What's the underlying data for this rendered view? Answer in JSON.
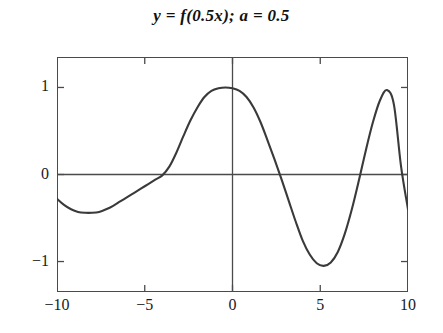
{
  "chart_data": {
    "type": "line",
    "title": "y = f(0.5x); a = 0.5",
    "xlabel": "",
    "ylabel": "",
    "xlim": [
      -10,
      10
    ],
    "ylim": [
      -1.35,
      1.35
    ],
    "grid": false,
    "legend": "none",
    "axis_lines": {
      "x_axis_at_y": 0,
      "y_axis_at_x": 0
    },
    "xticks": [
      -10,
      -5,
      0,
      5,
      10
    ],
    "xticklabels": [
      "−10",
      "−5",
      "0",
      "5",
      "10"
    ],
    "yticks": [
      1,
      0,
      -1
    ],
    "yticklabels": [
      "1",
      "0",
      "−1"
    ],
    "line_color": "#3a3a3a",
    "line_width": 2.1,
    "series": [
      {
        "name": "y = f(0.5x)",
        "x": [
          -10.0,
          -9.6,
          -9.2,
          -8.8,
          -8.4,
          -8.0,
          -7.6,
          -7.2,
          -6.8,
          -6.4,
          -6.0,
          -5.6,
          -5.2,
          -4.8,
          -4.4,
          -4.0,
          -3.6,
          -3.2,
          -2.8,
          -2.4,
          -2.0,
          -1.6,
          -1.2,
          -0.8,
          -0.4,
          0.0,
          0.4,
          0.8,
          1.2,
          1.6,
          2.0,
          2.4,
          2.8,
          3.2,
          3.6,
          4.0,
          4.4,
          4.8,
          5.2,
          5.6,
          6.0,
          6.4,
          6.8,
          7.2,
          7.6,
          8.0,
          8.4,
          8.8,
          9.2,
          9.6,
          10.0
        ],
        "y": [
          -0.28,
          -0.35,
          -0.4,
          -0.43,
          -0.44,
          -0.44,
          -0.43,
          -0.4,
          -0.36,
          -0.31,
          -0.26,
          -0.21,
          -0.16,
          -0.11,
          -0.06,
          -0.01,
          0.09,
          0.25,
          0.44,
          0.62,
          0.77,
          0.89,
          0.96,
          0.99,
          1.0,
          0.99,
          0.96,
          0.89,
          0.77,
          0.6,
          0.39,
          0.17,
          -0.06,
          -0.3,
          -0.54,
          -0.76,
          -0.92,
          -1.02,
          -1.05,
          -1.01,
          -0.89,
          -0.68,
          -0.4,
          -0.07,
          0.28,
          0.6,
          0.85,
          0.97,
          0.8,
          0.1,
          -0.4
        ]
      }
    ],
    "annotations": []
  }
}
